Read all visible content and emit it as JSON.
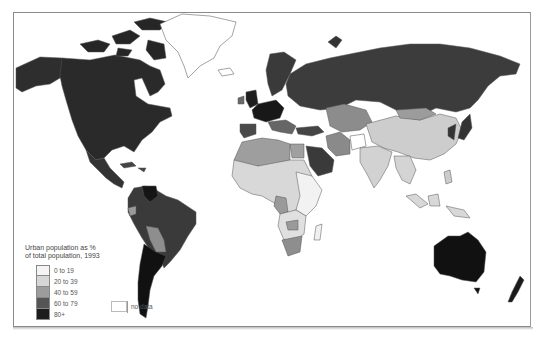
{
  "map": {
    "title": "Urban population as % of total population, 1993",
    "legend": {
      "title_line1": "Urban population as %",
      "title_line2": "of total population, 1993",
      "classes": [
        {
          "label": "0 to 19",
          "color": "#f4f4f4"
        },
        {
          "label": "20 to 39",
          "color": "#d6d6d6"
        },
        {
          "label": "40 to 59",
          "color": "#9c9c9c"
        },
        {
          "label": "60 to 79",
          "color": "#555555"
        },
        {
          "label": "80+",
          "color": "#1c1c1c"
        }
      ],
      "no_data": {
        "label": "no data",
        "color": "#ffffff"
      }
    },
    "regions": [
      {
        "name": "Canada",
        "class": "60 to 79"
      },
      {
        "name": "Alaska / USA",
        "class": "60 to 79"
      },
      {
        "name": "Greenland",
        "class": "no data"
      },
      {
        "name": "Mexico / Central America",
        "class": "60 to 79"
      },
      {
        "name": "Venezuela",
        "class": "80+"
      },
      {
        "name": "Brazil",
        "class": "60 to 79"
      },
      {
        "name": "Bolivia",
        "class": "40 to 59"
      },
      {
        "name": "Argentina / Chile / Uruguay",
        "class": "80+"
      },
      {
        "name": "Russia",
        "class": "60 to 79"
      },
      {
        "name": "Scandinavia",
        "class": "60 to 79"
      },
      {
        "name": "Western Europe",
        "class": "80+"
      },
      {
        "name": "Kazakhstan / Central Asia",
        "class": "40 to 59"
      },
      {
        "name": "China",
        "class": "20 to 39"
      },
      {
        "name": "India / South Asia",
        "class": "20 to 39"
      },
      {
        "name": "Japan / Korea",
        "class": "60 to 79"
      },
      {
        "name": "Southeast Asia",
        "class": "20 to 39"
      },
      {
        "name": "Saudi Arabia",
        "class": "60 to 79"
      },
      {
        "name": "Turkey",
        "class": "60 to 79"
      },
      {
        "name": "Iran",
        "class": "40 to 59"
      },
      {
        "name": "Afghanistan",
        "class": "0 to 19"
      },
      {
        "name": "North Africa",
        "class": "40 to 59"
      },
      {
        "name": "Sahel / Central Africa",
        "class": "20 to 39"
      },
      {
        "name": "East Africa",
        "class": "0 to 19"
      },
      {
        "name": "South Africa",
        "class": "40 to 59"
      },
      {
        "name": "Australia",
        "class": "80+"
      },
      {
        "name": "New Zealand",
        "class": "80+"
      }
    ]
  }
}
